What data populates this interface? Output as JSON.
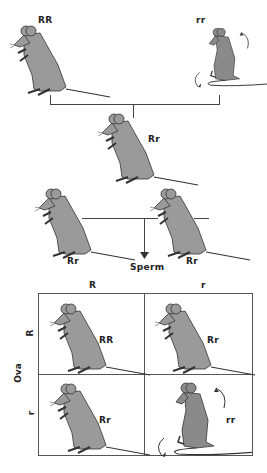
{
  "parents": {
    "left_genotype": "RR",
    "right_genotype": "rr"
  },
  "f1": {
    "genotype": "Rr"
  },
  "f1_cross": {
    "left_genotype": "Rr",
    "right_genotype": "Rr",
    "arrow_label": "Sperm"
  },
  "punnett": {
    "column_header_label": "Sperm",
    "row_header_label": "Ova",
    "columns": [
      "R",
      "r"
    ],
    "rows": [
      "R",
      "r"
    ],
    "cells": [
      [
        "RR",
        "Rr"
      ],
      [
        "Rr",
        "rr"
      ]
    ]
  },
  "colors": {
    "mouse_fill": "#9a9a9a",
    "mouse_dark_fill": "#8a8a8a",
    "outline": "#333333",
    "line": "#444444"
  }
}
